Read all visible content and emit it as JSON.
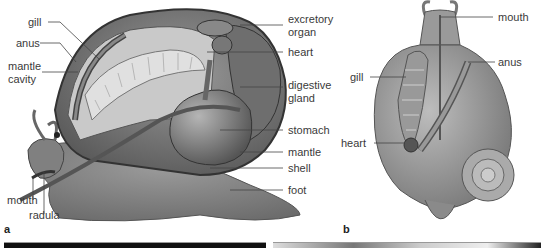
{
  "figure": {
    "panel_a": {
      "letter": "a",
      "labels": {
        "gill": "gill",
        "anus": "anus",
        "mantle_cavity_1": "mantle",
        "mantle_cavity_2": "cavity",
        "excretory_organ_1": "excretory",
        "excretory_organ_2": "organ",
        "heart": "heart",
        "digestive_gland_1": "digestive",
        "digestive_gland_2": "gland",
        "stomach": "stomach",
        "mantle": "mantle",
        "shell": "shell",
        "foot": "foot",
        "mouth": "mouth",
        "radula": "radula"
      }
    },
    "panel_b": {
      "letter": "b",
      "labels": {
        "mouth": "mouth",
        "anus": "anus",
        "gill": "gill",
        "heart": "heart"
      }
    },
    "colors": {
      "label_text": "#3a3a3a",
      "leader_line": "#444444",
      "body_gray": "#8a8a8a",
      "shell_gray": "#7a7a7a",
      "background": "#ffffff",
      "photo_left": "#111111",
      "photo_right": "#d8d8d8"
    }
  }
}
